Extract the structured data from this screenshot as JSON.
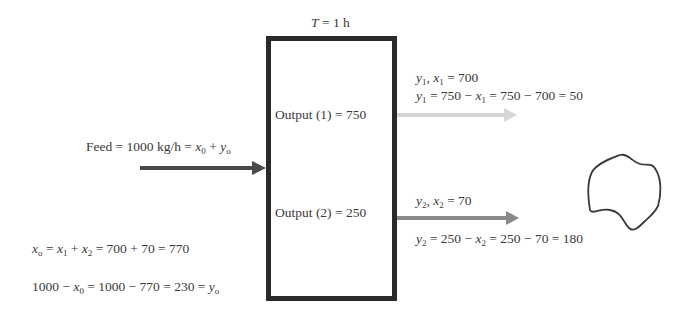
{
  "diagram": {
    "time_label": {
      "var": "T",
      "eq": " = 1 h"
    },
    "process_box": {
      "output1": "Output (1) = 750",
      "output2": "Output (2) = 250"
    },
    "feed": {
      "prefix": "Feed = 1000 kg/h = ",
      "x_var": "x",
      "x_sub": "0",
      "plus": " + ",
      "y_var": "y",
      "y_sub": "o"
    },
    "output1_annotation": {
      "line1": {
        "a": "y",
        "a_sub": "1",
        "sep": ", ",
        "b": "x",
        "b_sub": "1",
        "rest": " = 700"
      },
      "line2": {
        "a": "y",
        "a_sub": "1",
        "mid": " = 750 − ",
        "b": "x",
        "b_sub": "1",
        "rest": " = 750 − 700 = 50"
      }
    },
    "output2_annotation": {
      "line1": {
        "a": "y",
        "a_sub": "2",
        "sep": ", ",
        "b": "x",
        "b_sub": "2",
        "rest": " = 70"
      },
      "line2": {
        "a": "y",
        "a_sub": "2",
        "mid": " = 250 − ",
        "b": "x",
        "b_sub": "2",
        "rest": " = 250 − 70 = 180"
      }
    },
    "balance": {
      "line1": {
        "a": "x",
        "a_sub": "o",
        "eq": " = ",
        "b": "x",
        "b_sub": "1",
        "plus": " + ",
        "c": "x",
        "c_sub": "2",
        "rest": " = 700 + 70 = 770"
      },
      "line2": {
        "pre": "1000 − ",
        "a": "x",
        "a_sub": "0",
        "mid": " = 1000 − 770 = 230 =  ",
        "b": "y",
        "b_sub": "o"
      }
    },
    "arrows": {
      "feed_color": "#4a4a4a",
      "output1_color": "#d6d6d6",
      "output2_color": "#8a8a8a"
    },
    "blob_color": "#3a3a3a"
  }
}
